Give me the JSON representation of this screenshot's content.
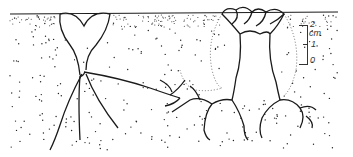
{
  "figure": {
    "scale_bar": {
      "labels": [
        "2",
        "cm",
        "1",
        "0"
      ],
      "unit": "cm"
    }
  },
  "colors": {
    "ink": "#1a1a1a",
    "background": "#ffffff"
  }
}
